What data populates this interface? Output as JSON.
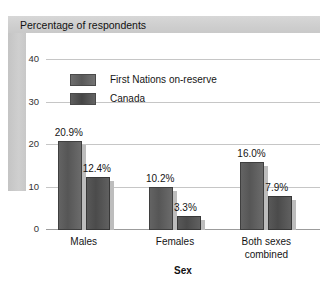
{
  "title": "Percentage of respondents",
  "chart_data": {
    "type": "bar",
    "title": "Percentage of respondents",
    "xlabel": "Sex",
    "ylabel": "",
    "ylim": [
      0,
      40
    ],
    "yticks": [
      "0",
      "10",
      "20",
      "30",
      "40"
    ],
    "ytick_values": [
      0,
      10,
      20,
      30,
      40
    ],
    "grid": true,
    "legend_position": "upper-left-inside",
    "categories": [
      "Males",
      "Females",
      "Both sexes\ncombined"
    ],
    "series": [
      {
        "name": "First Nations on-reserve",
        "color": "#565656",
        "values": [
          20.9,
          10.2,
          16.0
        ],
        "labels": [
          "20.9%",
          "10.2%",
          "16.0%"
        ]
      },
      {
        "name": "Canada",
        "color": "#4b4b4b",
        "values": [
          12.4,
          3.3,
          7.9
        ],
        "labels": [
          "12.4%",
          "3.3%",
          "7.9%"
        ]
      }
    ]
  },
  "colors": {
    "title_band": "#d2d2d2",
    "spine_band": "#c9c9c9",
    "gridline": "#c6c6c6",
    "axis": "#9c9c9c",
    "series_1": "#565656",
    "series_2": "#4b4b4b",
    "text": "#151515"
  }
}
